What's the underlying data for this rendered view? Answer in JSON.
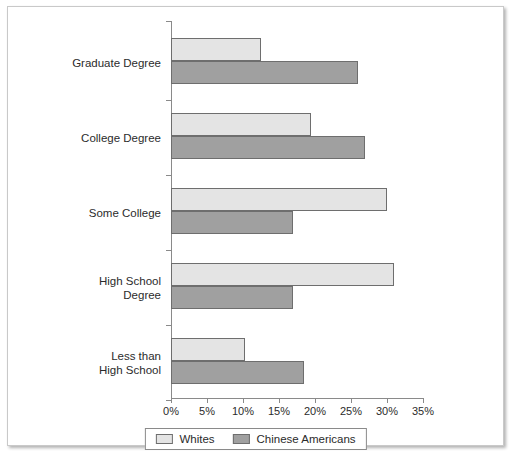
{
  "chart_data": {
    "type": "bar",
    "orientation": "horizontal",
    "title": "",
    "xlabel": "",
    "ylabel": "",
    "xlim": [
      0,
      35
    ],
    "grid": false,
    "legend_position": "bottom",
    "categories": [
      "Graduate Degree",
      "College Degree",
      "Some College",
      "High School Degree",
      "Less than High School"
    ],
    "category_lines": [
      [
        "Graduate Degree"
      ],
      [
        "College Degree"
      ],
      [
        "Some College"
      ],
      [
        "High School",
        "Degree"
      ],
      [
        "Less than",
        "High School"
      ]
    ],
    "tick_labels": [
      "0%",
      "5%",
      "10%",
      "15%",
      "20%",
      "25%",
      "30%",
      "35%"
    ],
    "tick_values": [
      0,
      5,
      10,
      15,
      20,
      25,
      30,
      35
    ],
    "series": [
      {
        "name": "Whites",
        "color": "#e4e4e4",
        "values": [
          12.5,
          19.5,
          30.0,
          31.0,
          10.3
        ]
      },
      {
        "name": "Chinese Americans",
        "color": "#a0a0a0",
        "values": [
          26.0,
          27.0,
          17.0,
          17.0,
          18.5
        ]
      }
    ]
  },
  "legend": {
    "items": [
      {
        "label": "Whites",
        "color": "#e4e4e4"
      },
      {
        "label": "Chinese Americans",
        "color": "#a0a0a0"
      }
    ]
  },
  "colors": {
    "whites_fill": "#e4e4e4",
    "chinese_fill": "#a0a0a0",
    "bar_border": "#6e6e6e",
    "axis": "#8a8a8a",
    "text": "#2b2b2b",
    "frame_border": "#c9c9c9",
    "background": "#ffffff"
  }
}
